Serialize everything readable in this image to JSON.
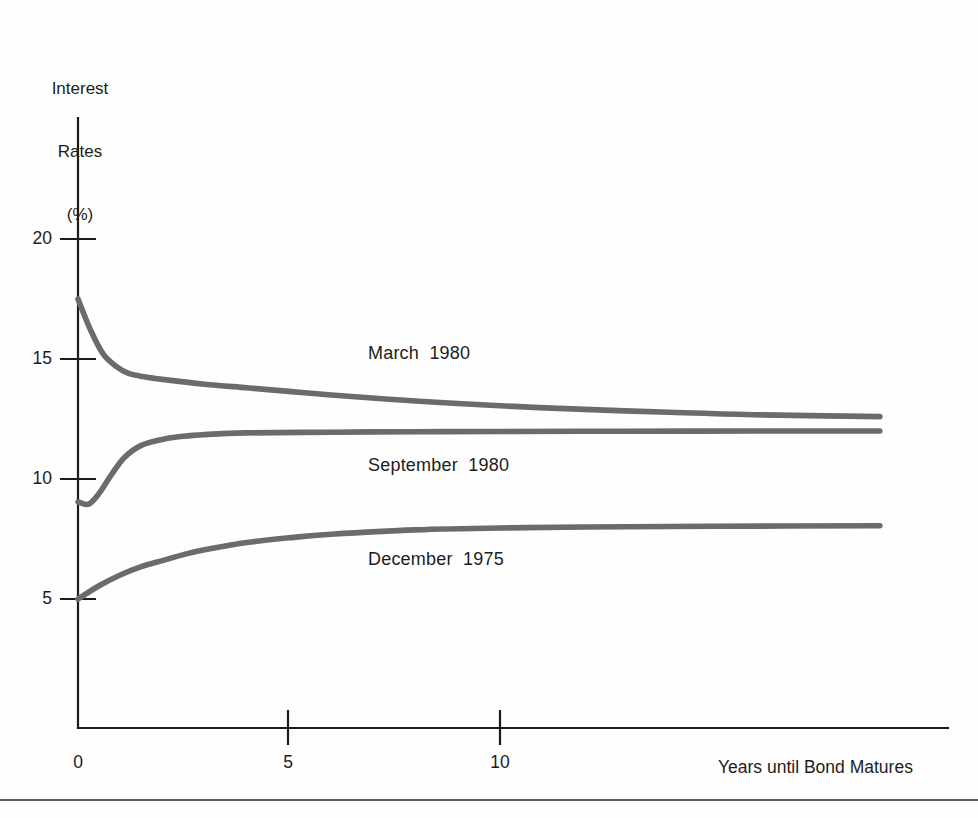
{
  "figure": {
    "background_color": "#fefefe",
    "axis_color": "#1c1c1c",
    "curve_color": "#6b6b6b"
  },
  "yaxis": {
    "title_line1": "Interest",
    "title_line2": "Rates",
    "title_line3": "(%)",
    "ticks": [
      "20",
      "15",
      "10",
      "5"
    ]
  },
  "xaxis": {
    "title": "Years until Bond Matures",
    "ticks": [
      "0",
      "5",
      "10"
    ]
  },
  "series_labels": {
    "march": "March  1980",
    "september": "September  1980",
    "december": "December  1975"
  },
  "chart_data": {
    "type": "line",
    "title": "",
    "subtitle": "",
    "xlabel": "Years until Bond Matures",
    "ylabel": "Interest Rates (%)",
    "xlim": [
      0,
      19
    ],
    "ylim": [
      0,
      22
    ],
    "xticks": [
      0,
      5,
      10
    ],
    "yticks": [
      5,
      10,
      15,
      20
    ],
    "grid": false,
    "legend": "inline-annotations",
    "annotations": [
      {
        "text": "March  1980",
        "x": 7.0,
        "y": 14.3
      },
      {
        "text": "September  1980",
        "x": 7.0,
        "y": 11.0
      },
      {
        "text": "December  1975",
        "x": 7.2,
        "y": 7.0
      }
    ],
    "series": [
      {
        "name": "March  1980",
        "color": "#6b6b6b",
        "x": [
          0,
          0.3,
          0.6,
          0.9,
          1.2,
          1.6,
          2.0,
          3.0,
          4.0,
          5.0,
          6.0,
          8.0,
          10.0,
          12.0,
          14.0,
          16.0,
          19.0
        ],
        "y": [
          17.5,
          16.2,
          15.2,
          14.7,
          14.4,
          14.25,
          14.15,
          13.95,
          13.8,
          13.65,
          13.5,
          13.25,
          13.05,
          12.9,
          12.78,
          12.68,
          12.6
        ]
      },
      {
        "name": "September  1980",
        "color": "#6b6b6b",
        "x": [
          0,
          0.25,
          0.5,
          0.8,
          1.1,
          1.5,
          2.0,
          2.5,
          3.0,
          4.0,
          6.0,
          8.0,
          10.0,
          13.0,
          16.0,
          19.0
        ],
        "y": [
          9.05,
          8.95,
          9.4,
          10.2,
          10.9,
          11.4,
          11.65,
          11.78,
          11.85,
          11.92,
          11.95,
          11.97,
          11.98,
          11.99,
          12.0,
          12.0
        ]
      },
      {
        "name": "December  1975",
        "color": "#6b6b6b",
        "x": [
          0,
          0.5,
          1.0,
          1.5,
          2.0,
          2.5,
          3.0,
          4.0,
          5.0,
          6.0,
          8.0,
          10.0,
          12.0,
          15.0,
          19.0
        ],
        "y": [
          5.0,
          5.55,
          6.0,
          6.35,
          6.6,
          6.85,
          7.05,
          7.35,
          7.55,
          7.7,
          7.88,
          7.96,
          8.0,
          8.03,
          8.05
        ]
      }
    ]
  }
}
